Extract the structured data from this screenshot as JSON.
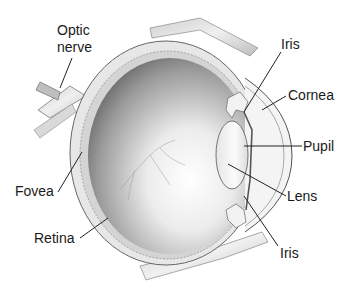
{
  "diagram": {
    "labels": [
      {
        "id": "optic-nerve",
        "lines": [
          "Optic",
          "nerve"
        ]
      },
      {
        "id": "iris-top",
        "text": "Iris"
      },
      {
        "id": "cornea",
        "text": "Cornea"
      },
      {
        "id": "pupil",
        "text": "Pupil"
      },
      {
        "id": "fovea",
        "text": "Fovea"
      },
      {
        "id": "lens",
        "text": "Lens"
      },
      {
        "id": "retina",
        "text": "Retina"
      },
      {
        "id": "iris-bottom",
        "text": "Iris"
      }
    ],
    "colors": {
      "background": "#ffffff",
      "label_text": "#1a1a1a",
      "leader_line": "#222222",
      "interior_dark": "#5a5a5a",
      "interior_light": "#f2f2f2",
      "tissue": "#d8d8d8"
    }
  }
}
